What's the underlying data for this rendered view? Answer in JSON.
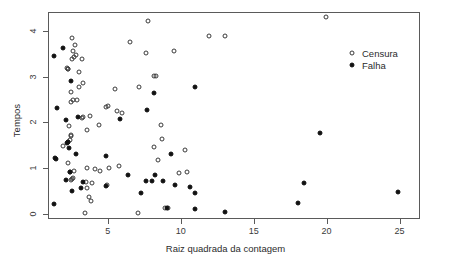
{
  "chart_data": {
    "type": "scatter",
    "title": "",
    "xlabel": "Raiz quadrada da contagem",
    "ylabel": "Tempos",
    "xlim": [
      0.9,
      26.4
    ],
    "ylim": [
      -0.12,
      4.42
    ],
    "xticks": [
      5,
      10,
      15,
      20,
      25
    ],
    "yticks": [
      0,
      1,
      2,
      3,
      4
    ],
    "grid": false,
    "legend_position": "top-right",
    "series": [
      {
        "name": "Censura",
        "marker": "open-circle",
        "color": "#3a3a3a",
        "points": [
          [
            2.55,
            3.86
          ],
          [
            2.75,
            3.7
          ],
          [
            2.6,
            3.56
          ],
          [
            2.85,
            3.47
          ],
          [
            2.55,
            3.4
          ],
          [
            3.25,
            3.39
          ],
          [
            2.2,
            3.2
          ],
          [
            2.25,
            3.17
          ],
          [
            3.05,
            3.1
          ],
          [
            8.15,
            3.02
          ],
          [
            8.3,
            3.01
          ],
          [
            3.3,
            2.86
          ],
          [
            7.75,
            4.22
          ],
          [
            3.0,
            2.77
          ],
          [
            7.15,
            2.77
          ],
          [
            5.5,
            2.74
          ],
          [
            2.45,
            2.66
          ],
          [
            2.6,
            2.49
          ],
          [
            2.45,
            2.44
          ],
          [
            5.0,
            2.35
          ],
          [
            4.9,
            2.33
          ],
          [
            5.6,
            2.25
          ],
          [
            3.75,
            2.15
          ],
          [
            5.95,
            2.21
          ],
          [
            3.3,
            2.12
          ],
          [
            3.25,
            2.1
          ],
          [
            2.35,
            1.93
          ],
          [
            4.4,
            1.95
          ],
          [
            8.65,
            1.94
          ],
          [
            3.55,
            1.83
          ],
          [
            2.5,
            1.73
          ],
          [
            2.45,
            1.7
          ],
          [
            2.4,
            1.62
          ],
          [
            8.7,
            1.63
          ],
          [
            2.3,
            1.57
          ],
          [
            8.2,
            1.45
          ],
          [
            10.3,
            1.4
          ],
          [
            1.95,
            1.48
          ],
          [
            8.45,
            1.17
          ],
          [
            2.25,
            1.1
          ],
          [
            5.8,
            1.05
          ],
          [
            3.55,
            0.99
          ],
          [
            4.1,
            0.98
          ],
          [
            5.1,
            0.99
          ],
          [
            2.7,
            0.94
          ],
          [
            2.4,
            0.92
          ],
          [
            4.45,
            0.93
          ],
          [
            9.9,
            0.89
          ],
          [
            10.45,
            0.9
          ],
          [
            2.6,
            0.79
          ],
          [
            2.55,
            0.75
          ],
          [
            2.5,
            0.73
          ],
          [
            3.5,
            0.7
          ],
          [
            3.95,
            0.66
          ],
          [
            4.95,
            0.62
          ],
          [
            3.6,
            0.57
          ],
          [
            3.7,
            0.37
          ],
          [
            3.85,
            0.27
          ],
          [
            3.45,
            0.01
          ],
          [
            7.1,
            0.01
          ],
          [
            8.95,
            0.13
          ],
          [
            9.15,
            0.12
          ],
          [
            11.95,
            3.9
          ],
          [
            13.05,
            3.9
          ],
          [
            6.55,
            3.76
          ],
          [
            7.65,
            3.51
          ],
          [
            9.55,
            3.57
          ],
          [
            19.95,
            4.31
          ],
          [
            2.3,
            3.18
          ],
          [
            2.65,
            3.43
          ],
          [
            2.9,
            2.49
          ]
        ]
      },
      {
        "name": "Falha",
        "marker": "filled-circle",
        "color": "#111111",
        "points": [
          [
            1.3,
            3.46
          ],
          [
            1.95,
            3.62
          ],
          [
            2.45,
            2.9
          ],
          [
            1.55,
            2.32
          ],
          [
            2.15,
            2.06
          ],
          [
            2.95,
            2.12
          ],
          [
            5.85,
            2.07
          ],
          [
            7.7,
            2.26
          ],
          [
            8.15,
            2.65
          ],
          [
            11.0,
            2.77
          ],
          [
            2.25,
            1.57
          ],
          [
            2.2,
            1.55
          ],
          [
            2.35,
            1.44
          ],
          [
            2.85,
            1.31
          ],
          [
            1.35,
            1.22
          ],
          [
            1.45,
            1.2
          ],
          [
            4.85,
            1.26
          ],
          [
            9.35,
            1.3
          ],
          [
            19.55,
            1.77
          ],
          [
            2.4,
            0.9
          ],
          [
            2.1,
            0.74
          ],
          [
            3.3,
            0.7
          ],
          [
            6.4,
            0.85
          ],
          [
            8.25,
            0.85
          ],
          [
            7.6,
            0.71
          ],
          [
            8.05,
            0.72
          ],
          [
            8.75,
            0.71
          ],
          [
            2.55,
            0.49
          ],
          [
            3.15,
            0.56
          ],
          [
            4.9,
            0.61
          ],
          [
            9.6,
            0.63
          ],
          [
            10.6,
            0.59
          ],
          [
            18.45,
            0.66
          ],
          [
            24.9,
            0.48
          ],
          [
            1.3,
            0.2
          ],
          [
            7.25,
            0.44
          ],
          [
            10.95,
            0.45
          ],
          [
            11.0,
            0.09
          ],
          [
            9.05,
            0.12
          ],
          [
            13.05,
            0.03
          ],
          [
            18.05,
            0.24
          ]
        ]
      }
    ]
  },
  "legend": {
    "items": [
      {
        "label": "Censura",
        "marker": "open-circle"
      },
      {
        "label": "Falha",
        "marker": "filled-circle"
      }
    ]
  }
}
